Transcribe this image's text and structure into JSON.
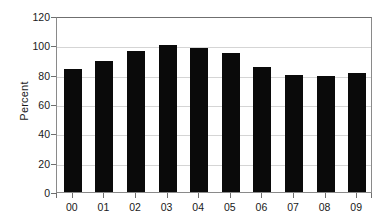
{
  "chart_data": {
    "type": "bar",
    "title": "",
    "xlabel": "",
    "ylabel": "Percent",
    "categories": [
      "00",
      "01",
      "02",
      "03",
      "04",
      "05",
      "06",
      "07",
      "08",
      "09"
    ],
    "values": [
      84,
      89,
      96,
      100,
      98,
      95,
      85,
      80,
      79,
      81
    ],
    "ylim": [
      0,
      120
    ],
    "ytick_labels": [
      "0",
      "20",
      "40",
      "60",
      "80",
      "100",
      "120"
    ],
    "ytick_values": [
      0,
      20,
      40,
      60,
      80,
      100,
      120
    ],
    "grid": "horizontal",
    "legend": "none",
    "bar_color": "#0a0a0a",
    "grid_color": "#d5d5d5",
    "axis_color": "#8a8a8a",
    "background": "#ffffff"
  }
}
